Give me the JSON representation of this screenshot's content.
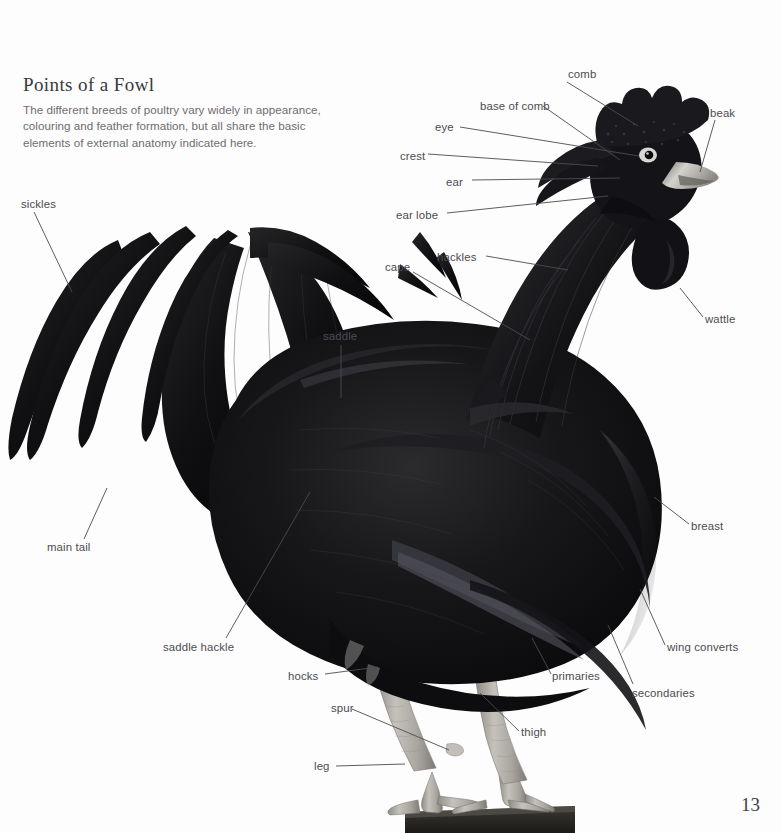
{
  "page": {
    "title": "Points of a Fowl",
    "intro": "The different breeds of poultry vary widely in appearance, colouring and feather formation, but all share the basic elements of external anatomy indicated here.",
    "page_number": "13",
    "background_color": "#fdfdfd",
    "text_color": "#4c4b50",
    "title_color": "#39383a",
    "leader_line_color": "#4c4b50"
  },
  "figure": {
    "plumage_color": "#111113",
    "leg_color": "#b9b6b1",
    "beak_color": "#c9c7c2",
    "perch_color": "#2e2b29"
  },
  "labels": [
    {
      "id": "comb",
      "text": "comb",
      "x": 568,
      "y": 68,
      "anchor": "start"
    },
    {
      "id": "base-of-comb",
      "text": "base of comb",
      "x": 480,
      "y": 100,
      "anchor": "start"
    },
    {
      "id": "beak",
      "text": "beak",
      "x": 710,
      "y": 107,
      "anchor": "start"
    },
    {
      "id": "eye",
      "text": "eye",
      "x": 435,
      "y": 121,
      "anchor": "start"
    },
    {
      "id": "crest",
      "text": "crest",
      "x": 400,
      "y": 150,
      "anchor": "start"
    },
    {
      "id": "ear",
      "text": "ear",
      "x": 446,
      "y": 176,
      "anchor": "start"
    },
    {
      "id": "ear-lobe",
      "text": "ear lobe",
      "x": 396,
      "y": 209,
      "anchor": "start"
    },
    {
      "id": "sickles",
      "text": "sickles",
      "x": 21,
      "y": 198,
      "anchor": "start"
    },
    {
      "id": "hackles",
      "text": "hackles",
      "x": 437,
      "y": 251,
      "anchor": "start"
    },
    {
      "id": "cape",
      "text": "cape",
      "x": 385,
      "y": 261,
      "anchor": "start"
    },
    {
      "id": "wattle",
      "text": "wattle",
      "x": 705,
      "y": 313,
      "anchor": "start"
    },
    {
      "id": "saddle",
      "text": "saddle",
      "x": 323,
      "y": 330,
      "anchor": "start"
    },
    {
      "id": "breast",
      "text": "breast",
      "x": 691,
      "y": 520,
      "anchor": "start"
    },
    {
      "id": "main-tail",
      "text": "main tail",
      "x": 47,
      "y": 541,
      "anchor": "start"
    },
    {
      "id": "saddle-hackle",
      "text": "saddle hackle",
      "x": 163,
      "y": 641,
      "anchor": "start"
    },
    {
      "id": "wing-converts",
      "text": "wing converts",
      "x": 667,
      "y": 641,
      "anchor": "start"
    },
    {
      "id": "primaries",
      "text": "primaries",
      "x": 552,
      "y": 670,
      "anchor": "start"
    },
    {
      "id": "hocks",
      "text": "hocks",
      "x": 288,
      "y": 670,
      "anchor": "start"
    },
    {
      "id": "secondaries",
      "text": "secondaries",
      "x": 632,
      "y": 687,
      "anchor": "start"
    },
    {
      "id": "spur",
      "text": "spur",
      "x": 331,
      "y": 702,
      "anchor": "start"
    },
    {
      "id": "thigh",
      "text": "thigh",
      "x": 521,
      "y": 726,
      "anchor": "start"
    },
    {
      "id": "leg",
      "text": "leg",
      "x": 314,
      "y": 760,
      "anchor": "start"
    }
  ],
  "leader_lines": [
    {
      "id": "comb-line",
      "points": "567,82 638,126"
    },
    {
      "id": "base-of-comb-line",
      "points": "543,106 620,160"
    },
    {
      "id": "beak-line",
      "points": "715,120 700,172"
    },
    {
      "id": "eye-line",
      "points": "460,127 639,156"
    },
    {
      "id": "crest-line",
      "points": "428,154 598,166"
    },
    {
      "id": "ear-line",
      "points": "472,180 620,178"
    },
    {
      "id": "ear-lobe-line",
      "points": "447,213 608,196"
    },
    {
      "id": "sickles-line",
      "points": "34,212 72,292"
    },
    {
      "id": "hackles-line",
      "points": "486,256 568,270"
    },
    {
      "id": "cape-line",
      "points": "413,272 530,340"
    },
    {
      "id": "wattle-line",
      "points": "703,317 680,288"
    },
    {
      "id": "saddle-line",
      "points": "341,345 341,398"
    },
    {
      "id": "breast-line",
      "points": "689,524 654,497"
    },
    {
      "id": "main-tail-line",
      "points": "84,539 107,488"
    },
    {
      "id": "saddle-hackle-line",
      "points": "226,638 310,492"
    },
    {
      "id": "wing-converts-line",
      "points": "665,645 640,589"
    },
    {
      "id": "primaries-line",
      "points": "551,674 532,638"
    },
    {
      "id": "hocks-line",
      "points": "325,674 378,667"
    },
    {
      "id": "secondaries-line",
      "points": "633,684 608,625"
    },
    {
      "id": "spur-line",
      "points": "352,709 449,750"
    },
    {
      "id": "thigh-line",
      "points": "519,731 480,693"
    },
    {
      "id": "leg-line",
      "points": "336,766 405,764"
    }
  ]
}
